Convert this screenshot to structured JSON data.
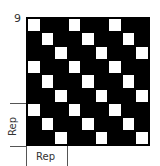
{
  "chart": {
    "row_count_label": "9",
    "rows": 9,
    "cols": 9,
    "colors": {
      "dark": "#000000",
      "light": "#ffffff"
    },
    "cells": [
      [
        1,
        0,
        0,
        1,
        0,
        0,
        1,
        0,
        0
      ],
      [
        0,
        1,
        0,
        0,
        1,
        0,
        0,
        1,
        0
      ],
      [
        0,
        0,
        1,
        0,
        0,
        1,
        0,
        0,
        1
      ],
      [
        1,
        0,
        0,
        1,
        0,
        0,
        1,
        0,
        0
      ],
      [
        0,
        1,
        0,
        0,
        1,
        0,
        0,
        1,
        0
      ],
      [
        0,
        0,
        1,
        0,
        0,
        1,
        0,
        0,
        1
      ],
      [
        1,
        0,
        0,
        1,
        0,
        0,
        1,
        0,
        0
      ],
      [
        0,
        1,
        0,
        0,
        1,
        0,
        0,
        1,
        0
      ],
      [
        0,
        0,
        1,
        0,
        0,
        1,
        0,
        0,
        1
      ]
    ],
    "rep_vertical_label": "Rep",
    "rep_vertical_rows": [
      7,
      9
    ],
    "rep_horizontal_label": "Rep",
    "rep_horizontal_cols": [
      1,
      3
    ]
  }
}
